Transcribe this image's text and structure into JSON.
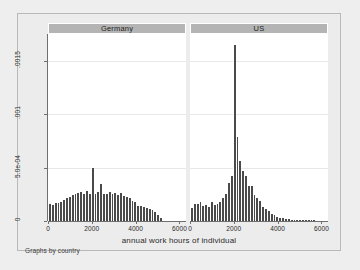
{
  "figure": {
    "note": "Graphs by country",
    "xtitle": "annual work hours of individual",
    "ytitle": "Density",
    "bar_color": "#4a4a4a",
    "header_color": "#b4b4b4",
    "page_color": "#ececec",
    "plot_color": "#ffffff"
  },
  "chart_data": {
    "type": "bar",
    "title": "",
    "subtitle": "",
    "xlabel": "annual work hours of individual",
    "ylabel": "Density",
    "caption": "Graphs by country",
    "grid": true,
    "legend": "none",
    "xlim": [
      0,
      6300
    ],
    "ylim": [
      0,
      0.00175
    ],
    "xticks": [
      0,
      2000,
      4000,
      6000
    ],
    "xticklabels": [
      "0",
      "2000",
      "4000",
      "6000"
    ],
    "yticks": [
      0,
      0.0005,
      0.001,
      0.0015
    ],
    "yticklabels": [
      "0",
      "5.0e-04",
      ".001",
      ".0015"
    ],
    "panels": [
      {
        "label": "Germany",
        "bin_width": 130,
        "bins": [
          {
            "x": 130,
            "density": 0.000155
          },
          {
            "x": 260,
            "density": 0.00015
          },
          {
            "x": 390,
            "density": 0.000165
          },
          {
            "x": 520,
            "density": 0.00017
          },
          {
            "x": 650,
            "density": 0.00018
          },
          {
            "x": 780,
            "density": 0.000195
          },
          {
            "x": 910,
            "density": 0.000215
          },
          {
            "x": 1040,
            "density": 0.000225
          },
          {
            "x": 1170,
            "density": 0.00024
          },
          {
            "x": 1300,
            "density": 0.00025
          },
          {
            "x": 1430,
            "density": 0.000265
          },
          {
            "x": 1560,
            "density": 0.00027
          },
          {
            "x": 1690,
            "density": 0.000255
          },
          {
            "x": 1820,
            "density": 0.00028
          },
          {
            "x": 1950,
            "density": 0.000255
          },
          {
            "x": 2080,
            "density": 0.0005
          },
          {
            "x": 2210,
            "density": 0.00025
          },
          {
            "x": 2340,
            "density": 0.00027
          },
          {
            "x": 2470,
            "density": 0.000345
          },
          {
            "x": 2600,
            "density": 0.000255
          },
          {
            "x": 2730,
            "density": 0.00025
          },
          {
            "x": 2860,
            "density": 0.00027
          },
          {
            "x": 2990,
            "density": 0.000255
          },
          {
            "x": 3120,
            "density": 0.000265
          },
          {
            "x": 3250,
            "density": 0.000245
          },
          {
            "x": 3380,
            "density": 0.00026
          },
          {
            "x": 3510,
            "density": 0.00023
          },
          {
            "x": 3640,
            "density": 0.000225
          },
          {
            "x": 3770,
            "density": 0.000215
          },
          {
            "x": 3900,
            "density": 0.00019
          },
          {
            "x": 4030,
            "density": 0.000175
          },
          {
            "x": 4160,
            "density": 0.000145
          },
          {
            "x": 4290,
            "density": 0.00014
          },
          {
            "x": 4420,
            "density": 0.00013
          },
          {
            "x": 4550,
            "density": 0.00012
          },
          {
            "x": 4680,
            "density": 0.00011
          },
          {
            "x": 4810,
            "density": 0.000105
          },
          {
            "x": 4940,
            "density": 8e-05
          },
          {
            "x": 5070,
            "density": 6e-05
          },
          {
            "x": 5200,
            "density": 3e-05
          }
        ]
      },
      {
        "label": "US",
        "bin_width": 130,
        "bins": [
          {
            "x": 130,
            "density": 0.000125
          },
          {
            "x": 260,
            "density": 0.00016
          },
          {
            "x": 390,
            "density": 0.00016
          },
          {
            "x": 520,
            "density": 0.000175
          },
          {
            "x": 650,
            "density": 0.00014
          },
          {
            "x": 780,
            "density": 0.00015
          },
          {
            "x": 910,
            "density": 0.00013
          },
          {
            "x": 1040,
            "density": 0.000175
          },
          {
            "x": 1170,
            "density": 0.00015
          },
          {
            "x": 1300,
            "density": 0.00016
          },
          {
            "x": 1430,
            "density": 0.000175
          },
          {
            "x": 1560,
            "density": 0.000215
          },
          {
            "x": 1690,
            "density": 0.000255
          },
          {
            "x": 1820,
            "density": 0.000355
          },
          {
            "x": 1950,
            "density": 0.00042
          },
          {
            "x": 2080,
            "density": 0.00165
          },
          {
            "x": 2210,
            "density": 0.00079
          },
          {
            "x": 2340,
            "density": 0.00056
          },
          {
            "x": 2470,
            "density": 0.00047
          },
          {
            "x": 2600,
            "density": 0.00042
          },
          {
            "x": 2730,
            "density": 0.00033
          },
          {
            "x": 2860,
            "density": 0.00033
          },
          {
            "x": 2990,
            "density": 0.000245
          },
          {
            "x": 3120,
            "density": 0.000215
          },
          {
            "x": 3250,
            "density": 0.000185
          },
          {
            "x": 3380,
            "density": 0.000135
          },
          {
            "x": 3510,
            "density": 0.000115
          },
          {
            "x": 3640,
            "density": 9e-05
          },
          {
            "x": 3770,
            "density": 7e-05
          },
          {
            "x": 3900,
            "density": 5.5e-05
          },
          {
            "x": 4030,
            "density": 4e-05
          },
          {
            "x": 4160,
            "density": 3e-05
          },
          {
            "x": 4290,
            "density": 2.5e-05
          },
          {
            "x": 4420,
            "density": 2.2e-05
          },
          {
            "x": 4550,
            "density": 1.8e-05
          },
          {
            "x": 4680,
            "density": 1.4e-05
          },
          {
            "x": 4810,
            "density": 1.2e-05
          },
          {
            "x": 4940,
            "density": 1e-05
          },
          {
            "x": 5070,
            "density": 9e-06
          },
          {
            "x": 5200,
            "density": 8e-06
          },
          {
            "x": 5330,
            "density": 7e-06
          },
          {
            "x": 5460,
            "density": 6e-06
          },
          {
            "x": 5590,
            "density": 9e-06
          },
          {
            "x": 5720,
            "density": 7e-06
          }
        ]
      }
    ]
  }
}
